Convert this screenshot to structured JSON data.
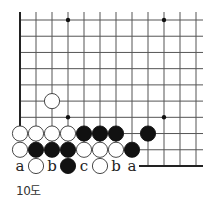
{
  "diagram": {
    "caption": "10도",
    "grid": {
      "origin_x": 20,
      "origin_y": 20,
      "spacing_x": 16,
      "spacing_y": 16.22,
      "cols": 12,
      "rows": 10,
      "line_color": "#555555",
      "edge_color": "#222222"
    },
    "star_points": [
      {
        "col": 3,
        "row": 0
      },
      {
        "col": 9,
        "row": 0
      },
      {
        "col": 3,
        "row": 6
      },
      {
        "col": 9,
        "row": 6
      }
    ],
    "stones": [
      {
        "color": "white",
        "col": 2,
        "row": 5
      },
      {
        "color": "white",
        "col": 0,
        "row": 7
      },
      {
        "color": "white",
        "col": 1,
        "row": 7
      },
      {
        "color": "white",
        "col": 2,
        "row": 7
      },
      {
        "color": "white",
        "col": 3,
        "row": 7
      },
      {
        "color": "black",
        "col": 4,
        "row": 7
      },
      {
        "color": "black",
        "col": 5,
        "row": 7
      },
      {
        "color": "black",
        "col": 6,
        "row": 7
      },
      {
        "color": "black",
        "col": 8,
        "row": 7
      },
      {
        "color": "white",
        "col": 0,
        "row": 8
      },
      {
        "color": "black",
        "col": 1,
        "row": 8
      },
      {
        "color": "black",
        "col": 2,
        "row": 8
      },
      {
        "color": "black",
        "col": 3,
        "row": 8
      },
      {
        "color": "white",
        "col": 4,
        "row": 8
      },
      {
        "color": "white",
        "col": 5,
        "row": 8
      },
      {
        "color": "white",
        "col": 6,
        "row": 8
      },
      {
        "color": "black",
        "col": 7,
        "row": 8
      },
      {
        "color": "white",
        "col": 1,
        "row": 9
      },
      {
        "color": "black",
        "col": 3,
        "row": 9
      },
      {
        "color": "white",
        "col": 5,
        "row": 9
      }
    ],
    "labels": [
      {
        "text": "a",
        "col": 0,
        "row": 9
      },
      {
        "text": "b",
        "col": 2,
        "row": 9
      },
      {
        "text": "c",
        "col": 4,
        "row": 9
      },
      {
        "text": "b",
        "col": 6,
        "row": 9
      },
      {
        "text": "a",
        "col": 7,
        "row": 9
      }
    ]
  }
}
